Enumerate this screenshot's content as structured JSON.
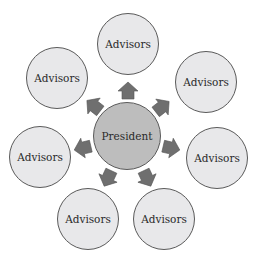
{
  "diagram": {
    "center": {
      "label": "President",
      "x": 127,
      "y": 136,
      "r": 34,
      "fill": "#bdbdbd"
    },
    "satellites": [
      {
        "label": "Advisors",
        "x": 128,
        "y": 44
      },
      {
        "label": "Advisors",
        "x": 57,
        "y": 78
      },
      {
        "label": "Advisors",
        "x": 206,
        "y": 82
      },
      {
        "label": "Advisors",
        "x": 40,
        "y": 157
      },
      {
        "label": "Advisors",
        "x": 217,
        "y": 158
      },
      {
        "label": "Advisors",
        "x": 88,
        "y": 219
      },
      {
        "label": "Advisors",
        "x": 164,
        "y": 219
      }
    ],
    "satellite_radius": 31,
    "satellite_fill": "#e8e8ea",
    "arrow_color": "#6f6f6f",
    "arrows": [
      {
        "x": 128,
        "y": 91,
        "angle": 0
      },
      {
        "x": 94,
        "y": 106,
        "angle": -52
      },
      {
        "x": 162,
        "y": 107,
        "angle": 52
      },
      {
        "x": 83,
        "y": 148,
        "angle": -103
      },
      {
        "x": 171,
        "y": 148,
        "angle": 103
      },
      {
        "x": 108,
        "y": 178,
        "angle": -155
      },
      {
        "x": 147,
        "y": 178,
        "angle": 155
      }
    ]
  }
}
